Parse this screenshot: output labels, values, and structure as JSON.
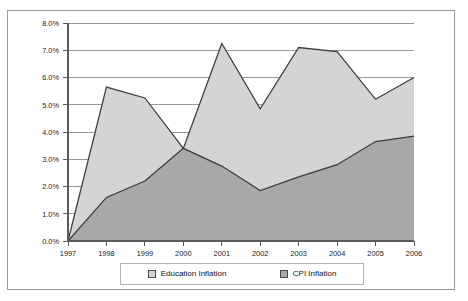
{
  "chart_data": {
    "type": "area",
    "title": "",
    "xlabel": "",
    "ylabel": "",
    "categories": [
      "1997",
      "1998",
      "1999",
      "2000",
      "2001",
      "2002",
      "2003",
      "2004",
      "2005",
      "2006"
    ],
    "series": [
      {
        "name": "Education Inflation",
        "color": "#d4d4d4",
        "values": [
          0.0,
          5.65,
          5.25,
          3.4,
          7.25,
          4.85,
          7.1,
          6.95,
          5.2,
          6.0
        ]
      },
      {
        "name": "CPI Inflation",
        "color": "#a8a8a8",
        "values": [
          0.0,
          1.6,
          2.2,
          3.4,
          2.75,
          1.85,
          2.35,
          2.8,
          3.65,
          3.85
        ]
      }
    ],
    "ylim": [
      0.0,
      8.0
    ],
    "y_ticks": [
      "0.0%",
      "1.0%",
      "2.0%",
      "3.0%",
      "4.0%",
      "5.0%",
      "6.0%",
      "7.0%",
      "8.0%"
    ],
    "y_tick_values": [
      0.0,
      1.0,
      2.0,
      3.0,
      4.0,
      5.0,
      6.0,
      7.0,
      8.0
    ],
    "grid": true,
    "legend_position": "bottom"
  },
  "legend": {
    "entries": [
      {
        "label": "Education Inflation",
        "swatch_color": "#d4d4d4"
      },
      {
        "label": "CPI Inflation",
        "swatch_color": "#a8a8a8"
      }
    ]
  },
  "colors": {
    "education_fill": "#d4d4d4",
    "cpi_fill": "#a8a8a8",
    "outline": "#3d3d3d",
    "gridline": "#6f6f6f",
    "frame_border": "#9a9a9a",
    "plot_background": "#ffffff"
  }
}
